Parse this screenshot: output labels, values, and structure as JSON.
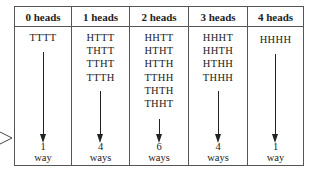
{
  "columns": [
    {
      "header": "0 heads",
      "outcomes": [
        "TTTT"
      ],
      "count": "1",
      "unit": "way"
    },
    {
      "header": "1 heads",
      "outcomes": [
        "HTTT",
        "THTT",
        "TTHT",
        "TTTH"
      ],
      "count": "4",
      "unit": "ways"
    },
    {
      "header": "2 heads",
      "outcomes": [
        "HHTT",
        "HTHT",
        "HTTH",
        "TTHH",
        "THTH",
        "THHT"
      ],
      "count": "6",
      "unit": "ways"
    },
    {
      "header": "3 heads",
      "outcomes": [
        "HHHT",
        "HHTH",
        "HTHH",
        "THHH"
      ],
      "count": "4",
      "unit": "ways"
    },
    {
      "header": "4 heads",
      "outcomes": [
        "HHHH"
      ],
      "count": "1",
      "unit": "way"
    }
  ],
  "colors": {
    "border": "#555555",
    "text": "#222222",
    "background": "#ffffff"
  }
}
